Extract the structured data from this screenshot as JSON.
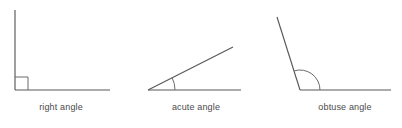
{
  "canvas": {
    "width": 402,
    "height": 128,
    "background": "#ffffff"
  },
  "style": {
    "line_color": "#585858",
    "arc_color": "#6a6a6a",
    "text_color": "#4a4a4a",
    "line_width": 1.15,
    "label_font_size": 9
  },
  "figures": [
    {
      "id": "right-angle",
      "label": "right angle",
      "angle_degrees": 90,
      "marker": "square",
      "vertex": {
        "x": 15,
        "y": 90
      },
      "rays": [
        {
          "name": "vertical-ray",
          "x1": 15,
          "y1": 10,
          "x2": 15,
          "y2": 90
        },
        {
          "name": "horizontal-ray",
          "x1": 15,
          "y1": 90,
          "x2": 110,
          "y2": 90
        }
      ],
      "marker_geometry": {
        "size": 13
      },
      "label_position": {
        "x": 61,
        "y": 110
      }
    },
    {
      "id": "acute-angle",
      "label": "acute angle",
      "angle_degrees": 27,
      "marker": "arc",
      "vertex": {
        "x": 148,
        "y": 90
      },
      "rays": [
        {
          "name": "baseline-ray",
          "x1": 148,
          "y1": 90,
          "x2": 241,
          "y2": 90
        },
        {
          "name": "slanted-ray",
          "x1": 148,
          "y1": 90,
          "x2": 233,
          "y2": 47
        }
      ],
      "marker_geometry": {
        "radius": 27
      },
      "label_position": {
        "x": 196,
        "y": 110
      }
    },
    {
      "id": "obtuse-angle",
      "label": "obtuse angle",
      "angle_degrees": 107,
      "marker": "arc",
      "vertex": {
        "x": 300,
        "y": 90
      },
      "rays": [
        {
          "name": "baseline-ray",
          "x1": 300,
          "y1": 90,
          "x2": 391,
          "y2": 90
        },
        {
          "name": "slanted-ray",
          "x1": 300,
          "y1": 90,
          "x2": 277,
          "y2": 17
        }
      ],
      "marker_geometry": {
        "radius": 20
      },
      "label_position": {
        "x": 345,
        "y": 110
      }
    }
  ]
}
